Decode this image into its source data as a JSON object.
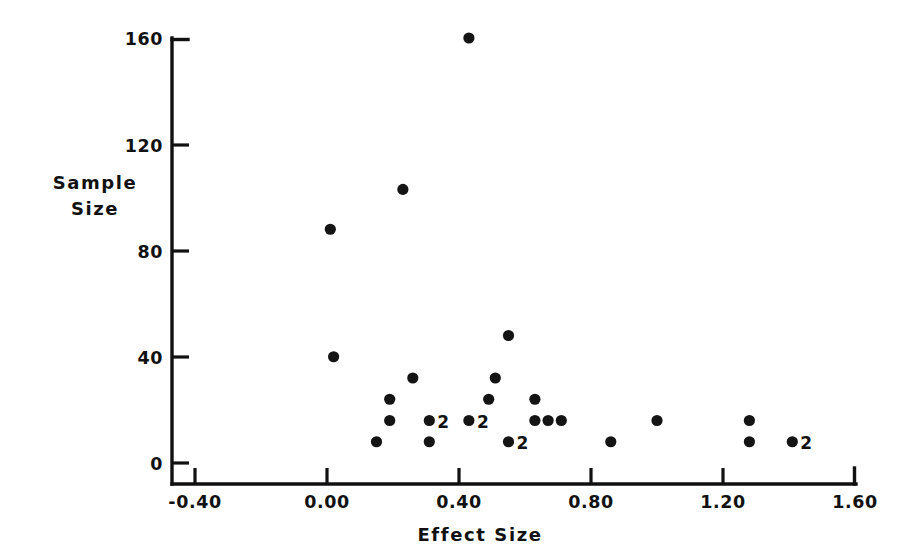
{
  "chart_data": {
    "type": "scatter",
    "title": "",
    "xlabel": "Effect Size",
    "ylabel": "Sample Size",
    "xlim": [
      -0.4,
      1.6
    ],
    "ylim": [
      0,
      160
    ],
    "xticks": [
      -0.4,
      0.0,
      0.4,
      0.8,
      1.2,
      1.6
    ],
    "xticklabels": [
      "-0.40",
      "0.00",
      "0.40",
      "0.80",
      "1.20",
      "1.60"
    ],
    "yticks": [
      0,
      40,
      80,
      120,
      160
    ],
    "yticklabels": [
      "0",
      "40",
      "80",
      "120",
      "160"
    ],
    "grid": false,
    "legend": null,
    "marker": "filled-circle",
    "marker_color": "#141414",
    "axis_color": "#111111",
    "background": "#ffffff",
    "note": "Labels '2' next to a marker indicate two overlapping studies at that coordinate.",
    "points": [
      {
        "x": 0.43,
        "y": 160,
        "count": 1,
        "label": ""
      },
      {
        "x": 0.23,
        "y": 103,
        "count": 1,
        "label": ""
      },
      {
        "x": 0.01,
        "y": 88,
        "count": 1,
        "label": ""
      },
      {
        "x": 0.55,
        "y": 48,
        "count": 1,
        "label": ""
      },
      {
        "x": 0.02,
        "y": 40,
        "count": 1,
        "label": ""
      },
      {
        "x": 0.26,
        "y": 32,
        "count": 1,
        "label": ""
      },
      {
        "x": 0.51,
        "y": 32,
        "count": 1,
        "label": ""
      },
      {
        "x": 0.19,
        "y": 24,
        "count": 1,
        "label": ""
      },
      {
        "x": 0.49,
        "y": 24,
        "count": 1,
        "label": ""
      },
      {
        "x": 0.63,
        "y": 24,
        "count": 1,
        "label": ""
      },
      {
        "x": 0.19,
        "y": 16,
        "count": 1,
        "label": ""
      },
      {
        "x": 0.31,
        "y": 16,
        "count": 2,
        "label": "2"
      },
      {
        "x": 0.43,
        "y": 16,
        "count": 2,
        "label": "2"
      },
      {
        "x": 0.63,
        "y": 16,
        "count": 1,
        "label": ""
      },
      {
        "x": 0.67,
        "y": 16,
        "count": 1,
        "label": ""
      },
      {
        "x": 0.71,
        "y": 16,
        "count": 1,
        "label": ""
      },
      {
        "x": 1.0,
        "y": 16,
        "count": 1,
        "label": ""
      },
      {
        "x": 1.28,
        "y": 16,
        "count": 1,
        "label": ""
      },
      {
        "x": 0.15,
        "y": 8,
        "count": 1,
        "label": ""
      },
      {
        "x": 0.31,
        "y": 8,
        "count": 1,
        "label": ""
      },
      {
        "x": 0.55,
        "y": 8,
        "count": 2,
        "label": "2"
      },
      {
        "x": 0.86,
        "y": 8,
        "count": 1,
        "label": ""
      },
      {
        "x": 1.28,
        "y": 8,
        "count": 1,
        "label": ""
      },
      {
        "x": 1.41,
        "y": 8,
        "count": 2,
        "label": "2"
      }
    ]
  },
  "axis_titles": {
    "y_line1": "Sample",
    "y_line2": "Size",
    "x": "Effect Size"
  }
}
